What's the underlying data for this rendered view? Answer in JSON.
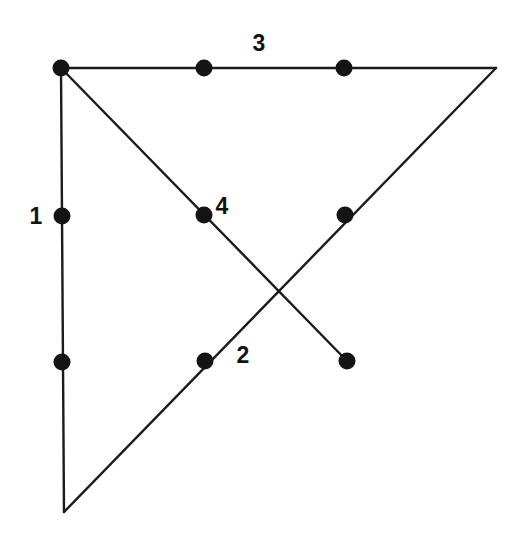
{
  "figure": {
    "background_color": "#ffffff",
    "stroke_color": "#1b1b1b",
    "dot_color": "#141414",
    "label_color": "#121212",
    "canvas": {
      "width": 524,
      "height": 542
    }
  },
  "labels": [
    {
      "id": "label-1",
      "text": "1",
      "x": 36,
      "y": 216
    },
    {
      "id": "label-2",
      "text": "2",
      "x": 243,
      "y": 355
    },
    {
      "id": "label-3",
      "text": "3",
      "x": 259,
      "y": 43
    },
    {
      "id": "label-4",
      "text": "4",
      "x": 222,
      "y": 206
    }
  ],
  "chart_data": {
    "type": "diagram",
    "xlabel": "",
    "ylabel": "",
    "xlim": [
      0,
      524
    ],
    "ylim": [
      0,
      542
    ],
    "grid": false,
    "legend": "none",
    "segments": [
      {
        "name": "1",
        "description": "vertical left edge",
        "x1": 61,
        "y1": 68,
        "x2": 64,
        "y2": 512,
        "label": "1"
      },
      {
        "name": "2",
        "description": "rising diagonal from bottom-left vertex to top-right vertex",
        "x1": 64,
        "y1": 512,
        "x2": 496,
        "y2": 68,
        "label": "2"
      },
      {
        "name": "3",
        "description": "top horizontal edge",
        "x1": 61,
        "y1": 68,
        "x2": 496,
        "y2": 68,
        "label": "3"
      },
      {
        "name": "4",
        "description": "descending diagonal from top-left vertex to free endpoint",
        "x1": 61,
        "y1": 68,
        "x2": 347,
        "y2": 361,
        "label": "4"
      }
    ],
    "points": [
      {
        "name": "top-left-vertex",
        "x": 61,
        "y": 68,
        "r": 8.5,
        "on": [
          "1",
          "3",
          "4"
        ]
      },
      {
        "name": "top-edge-point-a",
        "x": 204,
        "y": 68,
        "r": 8.5,
        "on": [
          "3"
        ]
      },
      {
        "name": "top-edge-point-b",
        "x": 344,
        "y": 68,
        "r": 8.5,
        "on": [
          "3"
        ]
      },
      {
        "name": "left-edge-point-upper",
        "x": 62,
        "y": 216,
        "r": 8.5,
        "on": [
          "1"
        ]
      },
      {
        "name": "left-edge-point-lower",
        "x": 62,
        "y": 362,
        "r": 8.5,
        "on": [
          "1"
        ]
      },
      {
        "name": "diagonal-4-point",
        "x": 204,
        "y": 215,
        "r": 8.5,
        "on": [
          "4"
        ]
      },
      {
        "name": "diagonal-2-point-upper",
        "x": 345,
        "y": 215,
        "r": 8.5,
        "on": [
          "2"
        ]
      },
      {
        "name": "diagonal-2-point-lower",
        "x": 205,
        "y": 361,
        "r": 8.5,
        "on": [
          "2"
        ]
      },
      {
        "name": "diagonal-4-endpoint",
        "x": 347,
        "y": 361,
        "r": 8.5,
        "on": [
          "4"
        ]
      }
    ],
    "unmarked_vertices": [
      {
        "name": "top-right-vertex",
        "x": 496,
        "y": 68
      },
      {
        "name": "bottom-left-vertex",
        "x": 64,
        "y": 512
      }
    ],
    "intersections": [
      {
        "name": "diagonal-crossing",
        "x": 277,
        "y": 288,
        "between": [
          "2",
          "4"
        ]
      }
    ],
    "labels": [
      "1",
      "2",
      "3",
      "4"
    ]
  }
}
